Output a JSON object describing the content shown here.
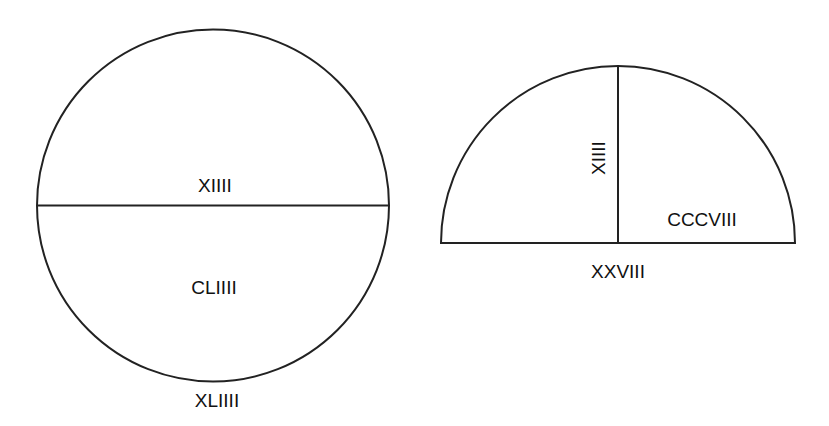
{
  "diagram": {
    "type": "geometry-figures",
    "stroke_color": "#222222",
    "text_color": "#111111",
    "figures": [
      {
        "name": "circle",
        "center": [
          213,
          205
        ],
        "radius": 176,
        "labels": {
          "diameter": "XIIII",
          "area": "CLIIII",
          "circumference": "XLIIII"
        }
      },
      {
        "name": "semicircle",
        "center": [
          618,
          243
        ],
        "radius": 177,
        "labels": {
          "radius": "XIIII",
          "area": "CCCVIII",
          "diameter": "XXVIII"
        }
      }
    ]
  }
}
